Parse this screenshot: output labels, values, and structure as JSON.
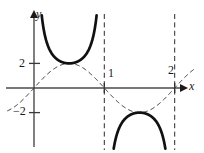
{
  "figure": {
    "title": "",
    "axes": {
      "x_axis_label": "x",
      "y_axis_label": "y"
    },
    "tick_labels": {
      "y_positive": "2",
      "y_negative": "−2",
      "x_one": "1",
      "x_two": "2"
    }
  },
  "chart_data": {
    "type": "line",
    "title": "",
    "xlabel": "x",
    "ylabel": "y",
    "xlim": [
      -0.48,
      2.42
    ],
    "ylim": [
      -6.2,
      6.1
    ],
    "grid": false,
    "legend": null,
    "x_ticks": [
      1,
      2
    ],
    "x_tick_labels": [
      "1",
      "2"
    ],
    "y_ticks": [
      2,
      -2
    ],
    "y_tick_labels": [
      "2",
      "−2"
    ],
    "asymptotes": {
      "vertical": [
        1,
        2
      ],
      "style": "dashed"
    },
    "series": [
      {
        "name": "y = 2 sin(πx)",
        "style": "dashed",
        "color": "#1a1a1a",
        "width": 1,
        "equation": "2*sin(PI*x)",
        "x": [
          0.0,
          0.1,
          0.2,
          0.3,
          0.4,
          0.5,
          0.6,
          0.7,
          0.8,
          0.9,
          1.0,
          1.1,
          1.2,
          1.3,
          1.4,
          1.5,
          1.6,
          1.7,
          1.8,
          1.9,
          2.0
        ],
        "values": [
          0.0,
          0.62,
          1.18,
          1.62,
          1.9,
          2.0,
          1.9,
          1.62,
          1.18,
          0.62,
          0.0,
          -0.62,
          -1.18,
          -1.62,
          -1.9,
          -2.0,
          -1.9,
          -1.62,
          -1.18,
          -0.62,
          0.0
        ]
      },
      {
        "name": "y = 2 csc(πx)  branch on (0, 1)",
        "style": "solid",
        "color": "#111111",
        "width": 2.6,
        "equation": "2/sin(PI*x)",
        "x": [
          0.1,
          0.15,
          0.2,
          0.25,
          0.3,
          0.35,
          0.4,
          0.45,
          0.5,
          0.55,
          0.6,
          0.65,
          0.7,
          0.75,
          0.8,
          0.85,
          0.9
        ],
        "values": [
          6.47,
          4.44,
          3.4,
          2.83,
          2.47,
          2.24,
          2.1,
          2.02,
          2.0,
          2.02,
          2.1,
          2.24,
          2.47,
          2.83,
          3.4,
          4.44,
          6.47
        ]
      },
      {
        "name": "y = 2 csc(πx)  branch on (1, 2)",
        "style": "solid",
        "color": "#111111",
        "width": 2.6,
        "equation": "2/sin(PI*x)",
        "x": [
          1.1,
          1.15,
          1.2,
          1.25,
          1.3,
          1.35,
          1.4,
          1.45,
          1.5,
          1.55,
          1.6,
          1.65,
          1.7,
          1.75,
          1.8,
          1.85,
          1.9
        ],
        "values": [
          -6.47,
          -4.44,
          -3.4,
          -2.83,
          -2.47,
          -2.24,
          -2.1,
          -2.02,
          -2.0,
          -2.02,
          -2.1,
          -2.24,
          -2.47,
          -2.83,
          -3.4,
          -4.44,
          -6.47
        ]
      }
    ]
  }
}
